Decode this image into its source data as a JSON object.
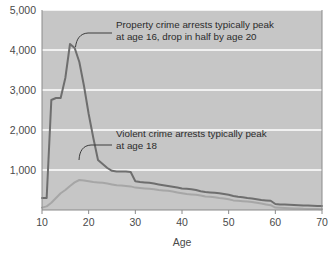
{
  "chart_data": {
    "type": "line",
    "title": "",
    "xlabel": "Age",
    "ylabel": "",
    "xlim": [
      10,
      70
    ],
    "ylim": [
      0,
      5000
    ],
    "grid": true,
    "legend_position": "none",
    "x_ticks": [
      10,
      20,
      30,
      40,
      50,
      60,
      70
    ],
    "x_tick_labels": [
      "10",
      "20",
      "30",
      "40",
      "50",
      "60",
      "70"
    ],
    "y_ticks": [
      1000,
      2000,
      3000,
      4000,
      5000
    ],
    "y_tick_labels": [
      "1,000",
      "2,000",
      "3,000",
      "4,000",
      "5,000"
    ],
    "x": [
      10,
      11,
      12,
      13,
      14,
      15,
      16,
      17,
      18,
      19,
      20,
      21,
      22,
      23,
      24,
      25,
      26,
      27,
      28,
      29,
      30,
      31,
      32,
      33,
      34,
      35,
      36,
      37,
      38,
      39,
      40,
      41,
      42,
      43,
      44,
      45,
      46,
      47,
      48,
      49,
      50,
      51,
      52,
      53,
      54,
      55,
      56,
      57,
      58,
      59,
      60,
      61,
      62,
      63,
      64,
      65,
      66,
      67,
      68,
      69,
      70
    ],
    "series": [
      {
        "name": "Property crime arrests",
        "color": "#6e6e6e",
        "values": [
          300,
          300,
          2750,
          2800,
          2800,
          3300,
          4150,
          4050,
          3700,
          3100,
          2400,
          1800,
          1250,
          1150,
          1050,
          980,
          960,
          960,
          960,
          950,
          720,
          700,
          690,
          680,
          660,
          640,
          620,
          600,
          580,
          560,
          540,
          530,
          520,
          500,
          470,
          450,
          440,
          430,
          420,
          400,
          380,
          350,
          330,
          320,
          300,
          290,
          270,
          250,
          240,
          230,
          150,
          140,
          135,
          130,
          125,
          120,
          115,
          110,
          105,
          100,
          100
        ]
      },
      {
        "name": "Violent crime arrests",
        "color": "#a6a6a6",
        "values": [
          60,
          90,
          180,
          300,
          420,
          500,
          600,
          690,
          750,
          740,
          720,
          700,
          690,
          680,
          660,
          640,
          620,
          610,
          600,
          590,
          560,
          550,
          540,
          530,
          520,
          500,
          490,
          480,
          460,
          440,
          420,
          400,
          390,
          380,
          360,
          340,
          330,
          320,
          300,
          290,
          270,
          240,
          230,
          220,
          210,
          200,
          180,
          160,
          140,
          120,
          60,
          55,
          50,
          45,
          40,
          35,
          30,
          28,
          25,
          22,
          20
        ]
      }
    ],
    "annotations": [
      {
        "id": "property-annotation",
        "line1": "Property crime arrests typically peak",
        "line2": "at age 16, drop in half by age 20",
        "points_to_x": 16,
        "points_to_y": 4150
      },
      {
        "id": "violent-annotation",
        "line1": "Violent crime arrests typically peak",
        "line2": "at age 18",
        "points_to_x": 18,
        "points_to_y": 750
      }
    ],
    "colors": {
      "plot_background": "#c6c6c6",
      "gridline": "#ffffff",
      "axis": "#8a8a8a",
      "text": "#4a4a4a",
      "annotation_text": "#2b2b2b",
      "leader_line": "#3c3c3c"
    }
  }
}
